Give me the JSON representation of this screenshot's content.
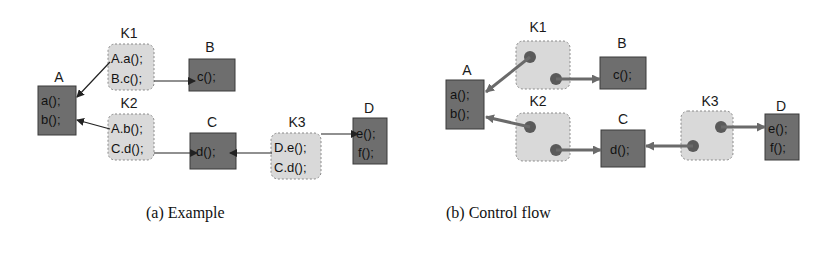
{
  "figure": {
    "colors": {
      "component_fill": "#6e6e6e",
      "component_border": "#3a3a3a",
      "connector_fill": "#d9d9d9",
      "connector_border": "#8a8a8a",
      "arrow_a": "#222222",
      "arrow_b": "#6a6a6a",
      "dot": "#5a5a5a"
    },
    "panel_a": {
      "caption": "(a) Example",
      "components": [
        {
          "name": "A",
          "lines": [
            "a();",
            "b();"
          ]
        },
        {
          "name": "B",
          "lines": [
            "c();"
          ]
        },
        {
          "name": "C",
          "lines": [
            "d();"
          ]
        },
        {
          "name": "D",
          "lines": [
            "e();",
            "f();"
          ]
        }
      ],
      "connectors": [
        {
          "name": "K1",
          "lines": [
            "A.a();",
            "B.c();"
          ]
        },
        {
          "name": "K2",
          "lines": [
            "A.b();",
            "C.d();"
          ]
        },
        {
          "name": "K3",
          "lines": [
            "D.e();",
            "C.d();"
          ]
        }
      ]
    },
    "panel_b": {
      "caption": "(b) Control flow",
      "components": [
        {
          "name": "A",
          "lines": [
            "a();",
            "b();"
          ]
        },
        {
          "name": "B",
          "lines": [
            "c();"
          ]
        },
        {
          "name": "C",
          "lines": [
            "d();"
          ]
        },
        {
          "name": "D",
          "lines": [
            "e();",
            "f();"
          ]
        }
      ],
      "connectors": [
        {
          "name": "K1"
        },
        {
          "name": "K2"
        },
        {
          "name": "K3"
        }
      ]
    }
  }
}
